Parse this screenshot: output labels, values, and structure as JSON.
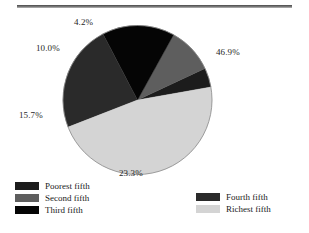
{
  "figure": {
    "background": "#ffffff",
    "rule_top_label": "top-divider-rule",
    "rule_bottom_label": "bottom-divider-rule"
  },
  "chart_data": {
    "type": "pie",
    "title": "",
    "xlabel": "",
    "ylabel": "",
    "legend_position": "bottom",
    "grid": false,
    "categories": [
      "Poorest fifth",
      "Second fifth",
      "Third fifth",
      "Fourth fifth",
      "Richest fifth"
    ],
    "values": [
      4.2,
      10.0,
      15.7,
      23.3,
      46.9
    ],
    "value_labels": [
      "4.2%",
      "10.0%",
      "15.7%",
      "23.3%",
      "46.9%"
    ],
    "colors": [
      "#1c1c1c",
      "#5e5e5e",
      "#050505",
      "#2a2a2a",
      "#d4d4d4"
    ],
    "start_angle_deg": -10,
    "direction": "counterclockwise",
    "slices": [
      {
        "label": "Poorest fifth",
        "value": 4.2,
        "value_label": "4.2%",
        "color": "#1c1c1c"
      },
      {
        "label": "Second fifth",
        "value": 10.0,
        "value_label": "10.0%",
        "color": "#5e5e5e"
      },
      {
        "label": "Third fifth",
        "value": 15.7,
        "value_label": "15.7%",
        "color": "#050505"
      },
      {
        "label": "Fourth fifth",
        "value": 23.3,
        "value_label": "23.3%",
        "color": "#2a2a2a"
      },
      {
        "label": "Richest fifth",
        "value": 46.9,
        "value_label": "46.9%",
        "color": "#d4d4d4"
      }
    ]
  },
  "legend": {
    "left_column": [
      {
        "label": "Poorest fifth",
        "color": "#1c1c1c"
      },
      {
        "label": "Second fifth",
        "color": "#5e5e5e"
      },
      {
        "label": "Third fifth",
        "color": "#050505"
      }
    ],
    "right_column": [
      {
        "label": "Fourth fifth",
        "color": "#2a2a2a"
      },
      {
        "label": "Richest fifth",
        "color": "#d4d4d4"
      }
    ]
  }
}
